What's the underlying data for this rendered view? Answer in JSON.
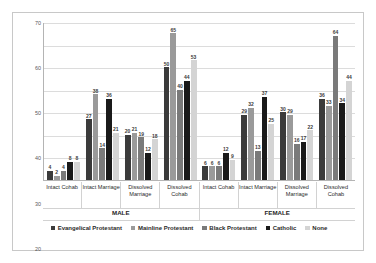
{
  "chart_data": {
    "type": "bar",
    "title": "",
    "xlabel": "",
    "ylabel": "",
    "ylim": [
      0,
      70
    ],
    "yticks": [
      0,
      10,
      20,
      30,
      40,
      50,
      60,
      70
    ],
    "grid": true,
    "legend_position": "bottom",
    "group_axis_label_top": [
      "Intact Cohab",
      "Intact Marriage",
      "Dissolved Marriage",
      "Dissolved Cohab",
      "Intact Cohab",
      "Intact Marriage",
      "Dissolved Marriage",
      "Dissolved Cohab"
    ],
    "categories": [
      "Intact Cohab",
      "Intact Marriage",
      "Dissolved Marriage",
      "Dissolved Cohab",
      "Intact Cohab",
      "Intact Marriage",
      "Dissolved Marriage",
      "Dissolved Cohab"
    ],
    "supergroups": [
      {
        "label": "MALE",
        "span": 4
      },
      {
        "label": "FEMALE",
        "span": 4
      }
    ],
    "series": [
      {
        "name": "Evangelical Protestant",
        "color": "#3b3b3b",
        "values": [
          4,
          27,
          20,
          50,
          6,
          29,
          30,
          36
        ]
      },
      {
        "name": "Mainline Protestant",
        "color": "#9a9a9a",
        "values": [
          2,
          38,
          21,
          65,
          6,
          32,
          29,
          33
        ]
      },
      {
        "name": "Black Protestant",
        "color": "#7a7a7a",
        "values": [
          4,
          14,
          19,
          40,
          6,
          13,
          16,
          64
        ]
      },
      {
        "name": "Catholic",
        "color": "#1a1a1a",
        "values": [
          8,
          36,
          12,
          44,
          12,
          37,
          17,
          34
        ]
      },
      {
        "name": "None",
        "color": "#d4d4d4",
        "values": [
          8,
          21,
          18,
          53,
          9,
          25,
          22,
          44
        ]
      }
    ]
  }
}
